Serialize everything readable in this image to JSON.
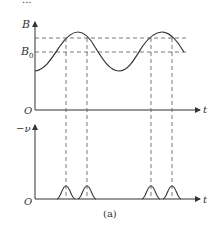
{
  "figure": {
    "caption": "(a)",
    "top_label_fragment": "...",
    "upper_plot": {
      "y_axis_label": "B",
      "origin_label": "O",
      "x_axis_label": "t",
      "reference_levels": [
        {
          "name": "upper-level",
          "label": ""
        },
        {
          "name": "B0-level",
          "label": "B",
          "subscript": "0"
        }
      ],
      "curve": "sinusoidal B(t), two peaks shown"
    },
    "lower_plot": {
      "y_axis_label": "−ν",
      "origin_label": "O",
      "x_axis_label": "t",
      "pulses": 4,
      "curve": "bell-shaped pulses aligned with times where B crosses the upper-level and B0 near peaks"
    },
    "colors": {
      "line": "#333333",
      "dashed": "#555555",
      "background": "#ffffff"
    }
  }
}
